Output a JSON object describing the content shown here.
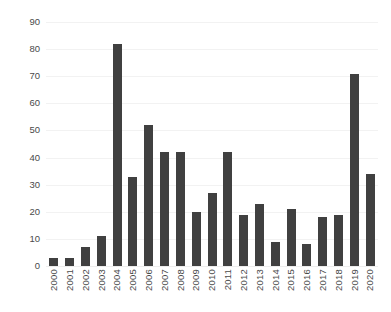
{
  "chart_data": {
    "type": "bar",
    "title": "",
    "subtitle": "",
    "xlabel": "",
    "ylabel": "",
    "ylim": [
      0,
      90
    ],
    "y_ticks": [
      0,
      10,
      20,
      30,
      40,
      50,
      60,
      70,
      80,
      90
    ],
    "grid": true,
    "legend": false,
    "legend_position": "none",
    "bar_color": "#404040",
    "gridline_color": "#f2f2f2",
    "axis_text_color": "#4a4a4a",
    "categories": [
      "2000",
      "2001",
      "2002",
      "2003",
      "2004",
      "2005",
      "2006",
      "2007",
      "2008",
      "2009",
      "2010",
      "2011",
      "2012",
      "2013",
      "2014",
      "2015",
      "2016",
      "2017",
      "2018",
      "2019",
      "2020"
    ],
    "values": [
      3,
      3,
      7,
      11,
      82,
      33,
      52,
      42,
      42,
      20,
      27,
      42,
      19,
      23,
      9,
      21,
      8,
      18,
      19,
      71,
      34
    ]
  }
}
